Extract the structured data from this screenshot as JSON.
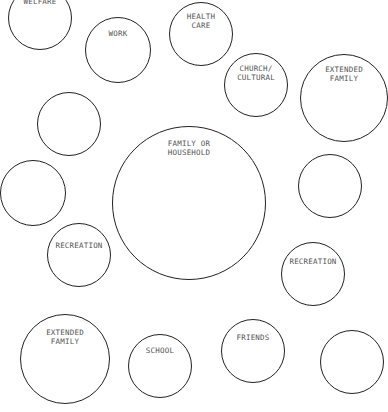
{
  "diagram": {
    "type": "ecomap",
    "line_color": "#222222",
    "text_color": "#555555",
    "circles": [
      {
        "id": "welfare",
        "label": "WELFARE",
        "cx": 40,
        "cy": 18,
        "r": 32,
        "label_top": 10
      },
      {
        "id": "work",
        "label": "WORK",
        "cx": 118,
        "cy": 50,
        "r": 33,
        "label_top": 11
      },
      {
        "id": "health-care",
        "label": "HEALTH\nCARE",
        "cx": 201,
        "cy": 34,
        "r": 32,
        "label_top": 9
      },
      {
        "id": "church-cultural",
        "label": "CHURCH/\nCULTURAL",
        "cx": 256,
        "cy": 85,
        "r": 32,
        "label_top": 10
      },
      {
        "id": "extended-family-right",
        "label": "EXTENDED\nFAMILY",
        "cx": 344,
        "cy": 98,
        "r": 44,
        "label_top": 10
      },
      {
        "id": "empty-left-upper",
        "label": "",
        "cx": 69,
        "cy": 124,
        "r": 32,
        "label_top": 10
      },
      {
        "id": "empty-far-left",
        "label": "",
        "cx": 33,
        "cy": 193,
        "r": 33,
        "label_top": 10
      },
      {
        "id": "family-or-household",
        "label": "FAMILY OR\nHOUSEHOLD",
        "cx": 189,
        "cy": 203,
        "r": 77,
        "label_top": 12
      },
      {
        "id": "empty-right",
        "label": "",
        "cx": 330,
        "cy": 186,
        "r": 32,
        "label_top": 10
      },
      {
        "id": "recreation-left",
        "label": "RECREATION",
        "cx": 79,
        "cy": 255,
        "r": 32,
        "label_top": 17
      },
      {
        "id": "recreation-right",
        "label": "RECREATION",
        "cx": 313,
        "cy": 274,
        "r": 32,
        "label_top": 14
      },
      {
        "id": "extended-family-bottom",
        "label": "EXTENDED\nFAMILY",
        "cx": 65,
        "cy": 359,
        "r": 45,
        "label_top": 13
      },
      {
        "id": "school",
        "label": "SCHOOL",
        "cx": 160,
        "cy": 366,
        "r": 32,
        "label_top": 11
      },
      {
        "id": "friends",
        "label": "FRIENDS",
        "cx": 253,
        "cy": 351,
        "r": 32,
        "label_top": 13
      },
      {
        "id": "empty-bottom-right",
        "label": "",
        "cx": 352,
        "cy": 362,
        "r": 32,
        "label_top": 10
      }
    ]
  }
}
